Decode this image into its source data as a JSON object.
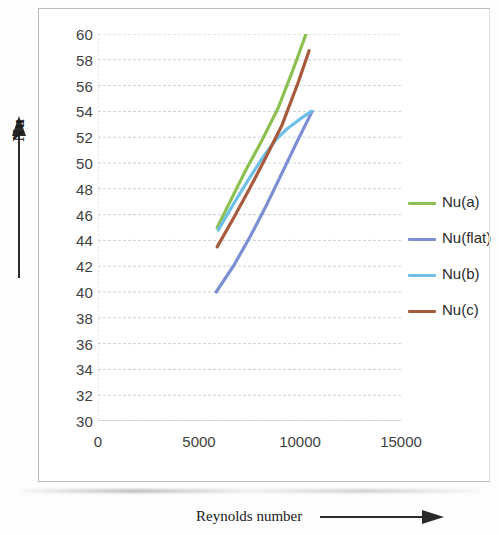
{
  "chart_data": {
    "type": "line",
    "title": "",
    "xlabel": "Reynolds number",
    "ylabel": "Nu",
    "xlim": [
      0,
      15000
    ],
    "ylim": [
      30,
      60
    ],
    "xticks": [
      0,
      5000,
      10000,
      15000
    ],
    "yticks": [
      30,
      32,
      34,
      36,
      38,
      40,
      42,
      44,
      46,
      48,
      50,
      52,
      54,
      56,
      58,
      60
    ],
    "grid": true,
    "legend_position": "right",
    "series": [
      {
        "name": "Nu(a)",
        "color": "#8cc152",
        "x": [
          5900,
          6600,
          7300,
          8100,
          8900,
          9600,
          10300
        ],
        "y": [
          45.0,
          47.2,
          49.4,
          51.7,
          54.2,
          57.0,
          60.0
        ]
      },
      {
        "name": "Nu(flat)",
        "color": "#7a8fd4",
        "x": [
          5850,
          6700,
          7500,
          8300,
          9100,
          9900,
          10600
        ],
        "y": [
          40.0,
          42.0,
          44.2,
          46.6,
          49.2,
          51.8,
          54.0
        ]
      },
      {
        "name": "Nu(b)",
        "color": "#6fc0e8",
        "x": [
          5950,
          6700,
          7400,
          8100,
          8800,
          9400,
          10000,
          10550
        ],
        "y": [
          44.8,
          46.8,
          48.6,
          50.3,
          51.8,
          52.7,
          53.4,
          54.0
        ]
      },
      {
        "name": "Nu(c)",
        "color": "#a85a3c",
        "x": [
          5900,
          6700,
          7500,
          8300,
          9100,
          9900,
          10450
        ],
        "y": [
          43.5,
          45.7,
          48.0,
          50.4,
          52.9,
          56.2,
          58.7
        ]
      }
    ]
  },
  "chart": {
    "y_axis_title": "Nu",
    "x_axis_title": "Reynolds number",
    "y_tick_labels": [
      "60",
      "58",
      "56",
      "54",
      "52",
      "50",
      "48",
      "46",
      "44",
      "42",
      "40",
      "38",
      "36",
      "34",
      "32",
      "30"
    ],
    "x_tick_labels": [
      "0",
      "5000",
      "10000",
      "15000"
    ]
  },
  "legend": {
    "items": [
      {
        "label": "Nu(a)",
        "color": "#8cc152"
      },
      {
        "label": "Nu(flat)",
        "color": "#7a8fd4"
      },
      {
        "label": "Nu(b)",
        "color": "#6fc0e8"
      },
      {
        "label": "Nu(c)",
        "color": "#a85a3c"
      }
    ]
  }
}
